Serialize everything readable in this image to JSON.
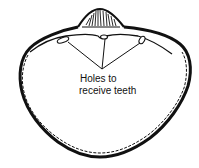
{
  "diagram": {
    "label_line1": "Holes to",
    "label_line2": "receive teeth",
    "colors": {
      "background": "#ffffff",
      "ink": "#111111"
    }
  }
}
